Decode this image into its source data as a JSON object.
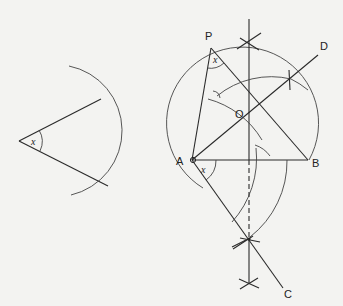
{
  "diagram": {
    "given_angle": {
      "label": "x"
    },
    "points": {
      "P": {
        "label": "P"
      },
      "O": {
        "label": "O"
      },
      "A": {
        "label": "A"
      },
      "B": {
        "label": "B"
      },
      "C": {
        "label": "C"
      },
      "D": {
        "label": "D"
      }
    },
    "angle_labels": {
      "at_P": "x",
      "at_A": "x"
    },
    "colors": {
      "background": "#f3f3f1",
      "line": "#2a2a2a"
    }
  }
}
